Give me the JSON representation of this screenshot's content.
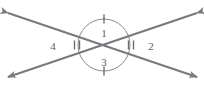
{
  "figure": {
    "background_color": "#ffffff",
    "line_color": "#7a787d",
    "arc_color": "#8a888d",
    "tick_color": "#6e6c71",
    "label_color": "#5d5b60",
    "intersection": {
      "x": 104,
      "y": 45
    },
    "arc_radius": 26
  },
  "lines": [
    {
      "name": "line-a",
      "from": {
        "x": 8,
        "y": 13
      },
      "to": {
        "x": 197,
        "y": 77
      },
      "arrow_start": true,
      "arrow_end": true
    },
    {
      "name": "line-b",
      "from": {
        "x": 197,
        "y": 13
      },
      "to": {
        "x": 8,
        "y": 77
      },
      "arrow_start": true,
      "arrow_end": true
    }
  ],
  "angles": [
    {
      "id": "angle-1",
      "label": "1",
      "position": "top",
      "label_x": 104,
      "label_y": 37,
      "tick_count": 1,
      "tick_x": 104,
      "tick_y": 19,
      "tick_orientation": "vertical"
    },
    {
      "id": "angle-2",
      "label": "2",
      "position": "right",
      "label_x": 151,
      "label_y": 50,
      "tick_count": 2,
      "tick_x": 131,
      "tick_y": 45,
      "tick_orientation": "horizontal"
    },
    {
      "id": "angle-3",
      "label": "3",
      "position": "bottom",
      "label_x": 104,
      "label_y": 66,
      "tick_count": 1,
      "tick_x": 104,
      "tick_y": 71,
      "tick_orientation": "vertical"
    },
    {
      "id": "angle-4",
      "label": "4",
      "position": "left",
      "label_x": 53,
      "label_y": 50,
      "tick_count": 2,
      "tick_x": 77,
      "tick_y": 45,
      "tick_orientation": "horizontal"
    }
  ]
}
